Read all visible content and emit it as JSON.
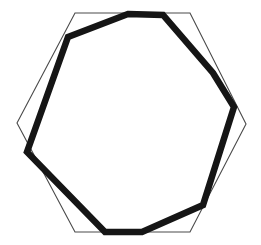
{
  "figure": {
    "title": "",
    "background_color": "#ffffff",
    "width": 261,
    "height": 245,
    "shapes": [
      {
        "name": "thin-hexagon",
        "label": "regular hexagon outline",
        "kind": "polygon",
        "sides": 6,
        "stroke_color": "#4a4a4a",
        "stroke_width": 1.1,
        "fill": "none",
        "points": "75,13 190,13 246,124 190,232 75,232 17,123"
      },
      {
        "name": "thick-octagon",
        "label": "rotated thick polygon outline",
        "kind": "polygon",
        "sides": 8,
        "stroke_color": "#151515",
        "stroke_width": 6.5,
        "fill": "none",
        "points": "128,14 163,15 213,73 234,107 203,205 142,232 105,232 27,152 68,37"
      }
    ]
  }
}
